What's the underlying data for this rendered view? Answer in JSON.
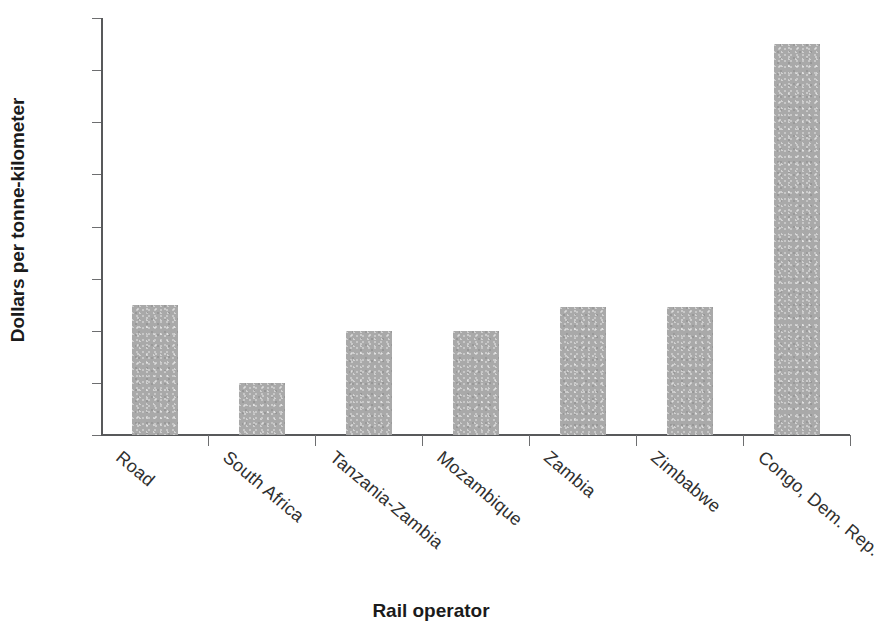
{
  "chart_data": {
    "type": "bar",
    "title": "",
    "xlabel": "Rail operator",
    "ylabel": "Dollars per tonne-kilometer",
    "categories": [
      "Road",
      "South Africa",
      "Tanzania-Zambia",
      "Mozambique",
      "Zambia",
      "Zimbabwe",
      "Congo, Dem. Rep."
    ],
    "values": [
      0.05,
      0.02,
      0.04,
      0.04,
      0.049,
      0.049,
      0.15
    ],
    "ylim": [
      0,
      0.16
    ],
    "ytick_values": [
      0,
      0.02,
      0.04,
      0.06,
      0.08,
      0.1,
      0.12,
      0.14,
      0.16
    ],
    "ytick_labels": [
      "0",
      "0.2",
      "0.4",
      "0.6",
      "0.8",
      "0.10",
      "0.12",
      "0.14",
      "0.16"
    ],
    "grid": false,
    "legend": false,
    "legend_position": "none",
    "series": [
      {
        "name": "Dollars per tonne-kilometer",
        "color": "#a9a9a9",
        "values": [
          0.05,
          0.02,
          0.04,
          0.04,
          0.049,
          0.049,
          0.15
        ]
      }
    ],
    "bar_color": "#a9a9a9",
    "axis_color": "#58595b",
    "text_color": "#231f20",
    "background": "#ffffff",
    "xtick_rotation": 40
  }
}
